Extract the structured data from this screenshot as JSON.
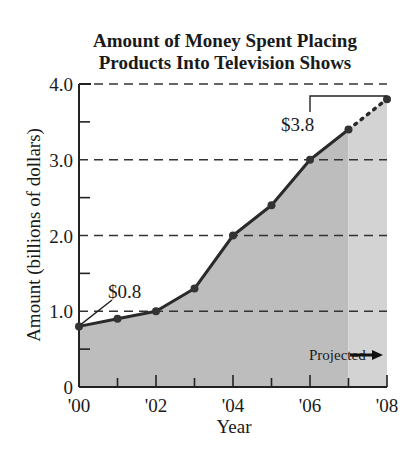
{
  "chart_data": {
    "type": "area",
    "title": "Amount of Money Spent Placing Products Into Television Shows",
    "title_lines": [
      "Amount of Money Spent Placing",
      "Products Into Television Shows"
    ],
    "xlabel": "Year",
    "ylabel": "Amount (billions of dollars)",
    "categories": [
      "'00",
      "'01",
      "'02",
      "'03",
      "'04",
      "'05",
      "'06",
      "'07",
      "'08"
    ],
    "x_tick_labels": [
      "'00",
      "'02",
      "'04",
      "'06",
      "'08"
    ],
    "y_tick_labels": [
      "0",
      "1.0",
      "2.0",
      "3.0",
      "4.0"
    ],
    "ylim": [
      0,
      4.0
    ],
    "grid": "horizontal dashed at 1.0, 2.0, 3.0, 4.0",
    "series": [
      {
        "name": "Actual",
        "x": [
          2000,
          2001,
          2002,
          2003,
          2004,
          2005,
          2006,
          2007
        ],
        "values": [
          0.8,
          0.9,
          1.0,
          1.3,
          2.0,
          2.4,
          3.0,
          3.4
        ]
      },
      {
        "name": "Projected",
        "x": [
          2007,
          2008
        ],
        "values": [
          3.4,
          3.8
        ]
      }
    ],
    "annotations": [
      {
        "text": "$0.8",
        "x": 2000,
        "y": 0.8
      },
      {
        "text": "$3.8",
        "x": 2008,
        "y": 3.8
      },
      {
        "text": "Projected",
        "arrow": "right",
        "region": [
          2007,
          2008
        ]
      }
    ],
    "colors": {
      "actual_fill": "#bdbdbd",
      "projected_fill": "#d3d3d3",
      "line": "#2a2a2a"
    }
  },
  "labels": {
    "title_line1": "Amount of Money Spent Placing",
    "title_line2": "Products Into Television Shows",
    "ylabel": "Amount (billions of dollars)",
    "xlabel": "Year",
    "annotation_start": "$0.8",
    "annotation_end": "$3.8",
    "projected": "Projected"
  }
}
